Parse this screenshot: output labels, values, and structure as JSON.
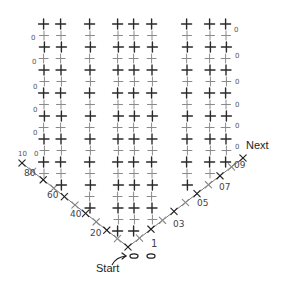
{
  "diagram": {
    "type": "crochet-stitch-chart",
    "stitch_colors": {
      "dark": "#2a2a2a",
      "light": "#8a8a8a"
    },
    "columns_x": [
      44,
      61,
      90,
      118,
      134,
      152,
      187,
      210,
      226
    ],
    "top_y": 24,
    "row_pitch": 11.5,
    "v_apex": {
      "x": 128,
      "y": 247
    },
    "left_diagonal_start": {
      "x": 22,
      "y": 163
    },
    "right_diagonal_end": {
      "x": 243,
      "y": 158
    }
  },
  "labels": {
    "left_rows": [
      "0",
      "0",
      "0",
      "0",
      "0",
      "0"
    ],
    "left_row_10_prefix": "10",
    "left_diagonal": [
      "80",
      "60",
      "40",
      "20"
    ],
    "right_rows": [
      "0",
      "0",
      "0",
      "0",
      "0",
      "0"
    ],
    "right_diagonal": [
      "09",
      "07",
      "05",
      "03",
      "1"
    ],
    "next": "Next",
    "start": "Start",
    "chain": [
      "0",
      "0"
    ]
  }
}
